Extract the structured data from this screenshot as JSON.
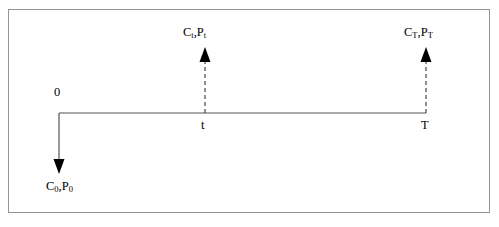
{
  "figure": {
    "title": "",
    "background_color": "#ffffff",
    "border_color": "#949494",
    "line_color": "#555555",
    "text_color": "#000000"
  },
  "diagram": {
    "type": "cash-flow-timeline",
    "axis": {
      "start_x": 59,
      "end_x": 426,
      "y": 113,
      "style": "solid"
    },
    "origin_label": "0",
    "ticks": [
      {
        "name": "t",
        "label": "t",
        "x": 205
      },
      {
        "name": "T",
        "label": "T",
        "x": 426
      }
    ],
    "arrows": [
      {
        "name": "outflow-at-zero",
        "direction": "down",
        "style": "solid",
        "x": 59,
        "from_y": 113,
        "to_y": 172,
        "label": "C0,P0"
      },
      {
        "name": "inflow-at-t",
        "direction": "up",
        "style": "dashed",
        "x": 205,
        "from_y": 113,
        "to_y": 48,
        "label": "Ct,Pt"
      },
      {
        "name": "inflow-at-T",
        "direction": "up",
        "style": "dashed",
        "x": 426,
        "from_y": 113,
        "to_y": 48,
        "label": "CT,PT"
      }
    ],
    "labels": {
      "c_t_base": "C",
      "c_t_sub": "t",
      "comma": ",",
      "p_t_base": "P",
      "p_t_sub": "t",
      "c_T_base": "C",
      "c_T_sub": "T",
      "p_T_base": "P",
      "p_T_sub": "T",
      "c_0_base": "C",
      "c_0_sub": "0",
      "p_0_base": "P",
      "p_0_sub": "0",
      "zero": "0",
      "tick_t": "t",
      "tick_T": "T"
    }
  }
}
